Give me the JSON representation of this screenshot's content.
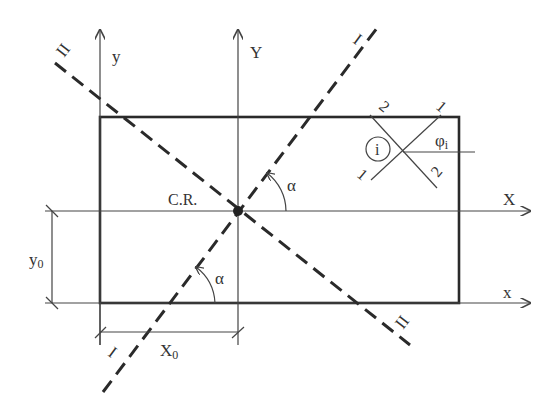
{
  "diagram": {
    "axes": {
      "y_label": "y",
      "Y_label": "Y",
      "X_label": "X",
      "x_label": "x"
    },
    "center_label": "C.R.",
    "angle_label_upper": "α",
    "angle_label_lower": "α",
    "line_I": {
      "label_top": "I",
      "label_bottom": "I"
    },
    "line_II": {
      "label_top": "II",
      "label_bottom": "II"
    },
    "dimensions": {
      "y0_label": "y",
      "y0_sub": "0",
      "x0_label": "X",
      "x0_sub": "0"
    },
    "element": {
      "id_label": "i",
      "phi_label": "φ",
      "phi_sub": "i",
      "dir1_top": "1",
      "dir1_bottom": "1",
      "dir2_top": "2",
      "dir2_bottom": "2"
    }
  }
}
